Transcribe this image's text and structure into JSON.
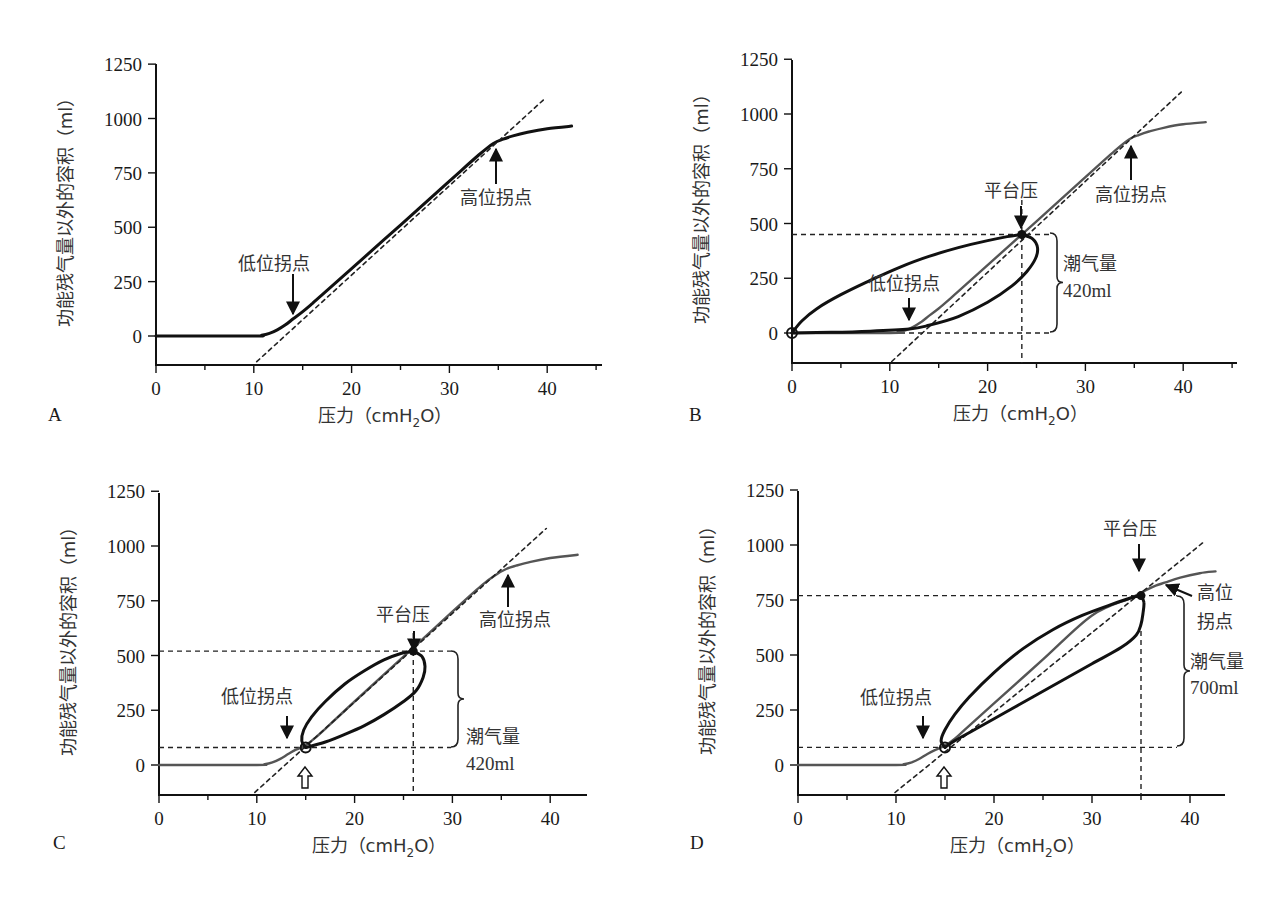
{
  "figure": {
    "panels_label": [
      "A",
      "B",
      "C",
      "D"
    ]
  },
  "chart_data": [
    {
      "panel": "A",
      "type": "line",
      "title": "",
      "xlabel": "压力（cmH2O）",
      "ylabel": "功能残气量以外的容积（ml）",
      "xlim": [
        0,
        46
      ],
      "ylim": [
        -133,
        1250
      ],
      "xticks": [
        0,
        10,
        20,
        30,
        40
      ],
      "yticks": [
        0,
        250,
        500,
        750,
        1000,
        1250
      ],
      "grid": false,
      "frame": {
        "x0": 156,
        "xs": 9.78,
        "y0": 336,
        "ys": 0.2175,
        "axis_bottom": 365,
        "axis_right": 602,
        "axis_top": 64
      },
      "series": [
        {
          "name": "静态压力-容积曲线",
          "style": "solid-black",
          "width": 3,
          "x": [
            0,
            10,
            10.8,
            11.6,
            12.4,
            13.2,
            14.0,
            15.0,
            16.0,
            17.0,
            20,
            25,
            30,
            33,
            34.5,
            35.5,
            36.5,
            38,
            40,
            42.5
          ],
          "y": [
            0,
            0,
            3,
            12,
            28,
            50,
            78,
            112,
            150,
            190,
            310,
            510,
            712,
            832,
            885,
            905,
            920,
            937,
            953,
            965
          ]
        },
        {
          "name": "线性段延长线",
          "style": "dashed",
          "width": 1.6,
          "x": [
            10.3,
            39.6
          ],
          "y": [
            -118,
            1085
          ]
        }
      ],
      "annotations": [
        {
          "text": "低位拐点",
          "x": 14.1,
          "y": 75,
          "text_x": 238,
          "text_y": 270,
          "arrow": "down",
          "arrow_x": 293,
          "arrow_y1": 274,
          "arrow_y2": 314
        },
        {
          "text": "高位拐点",
          "x": 35.0,
          "y": 890,
          "text_x": 460,
          "text_y": 204,
          "arrow": "up",
          "arrow_x": 496,
          "arrow_y1": 184,
          "arrow_y2": 149
        }
      ]
    },
    {
      "panel": "B",
      "type": "line",
      "title": "",
      "xlabel": "压力（cmH2O）",
      "ylabel": "功能残气量以外的容积（ml）",
      "xlim": [
        0,
        46
      ],
      "ylim": [
        -133,
        1250
      ],
      "xticks": [
        0,
        10,
        20,
        30,
        40
      ],
      "yticks": [
        0,
        250,
        500,
        750,
        1000,
        1250
      ],
      "grid": false,
      "frame": {
        "x0": 792,
        "xs": 9.78,
        "y0": 333,
        "ys": 0.219,
        "axis_bottom": 363,
        "axis_right": 1237,
        "axis_top": 60
      },
      "series": [
        {
          "name": "静态压力-容积曲线",
          "style": "solid-gray",
          "width": 2.4,
          "x": [
            0,
            10,
            10.8,
            11.6,
            12.4,
            13.2,
            14.0,
            15.0,
            16.0,
            17.0,
            20,
            25,
            30,
            33,
            34.5,
            35.5,
            36.5,
            38,
            40,
            42.3
          ],
          "y": [
            0,
            0,
            3,
            12,
            28,
            50,
            78,
            112,
            150,
            190,
            310,
            510,
            712,
            832,
            885,
            905,
            920,
            937,
            953,
            963
          ]
        },
        {
          "name": "线性段延长线",
          "style": "dashed",
          "width": 1.6,
          "x": [
            10.2,
            39.8
          ],
          "y": [
            -130,
            1100
          ]
        },
        {
          "name": "呼吸环-吸气支",
          "style": "loop",
          "width": 3,
          "x": [
            0,
            1,
            2.5,
            5,
            8,
            11,
            14,
            17,
            20,
            22,
            23.5
          ],
          "y": [
            0,
            55,
            110,
            175,
            240,
            300,
            350,
            390,
            422,
            440,
            450
          ]
        },
        {
          "name": "呼吸环-呼气支",
          "style": "loop",
          "width": 3,
          "x": [
            23.5,
            24.6,
            25.1,
            24.9,
            24.0,
            22.5,
            20,
            17,
            14,
            12,
            8,
            4,
            0
          ],
          "y": [
            450,
            430,
            390,
            340,
            280,
            215,
            140,
            75,
            35,
            18,
            8,
            3,
            0
          ]
        }
      ],
      "reference_lines": {
        "h": [
          450,
          0
        ],
        "v": [
          23.5
        ]
      },
      "points": [
        {
          "name": "起始点",
          "x": 0,
          "y": 0,
          "marker": "open-circle"
        },
        {
          "name": "平台压",
          "x": 23.5,
          "y": 450,
          "marker": "filled-circle"
        }
      ],
      "annotations": [
        {
          "text": "平台压",
          "text_x": 984,
          "text_y": 197,
          "arrow": "down",
          "arrow_x": 1021,
          "arrow_y1": 206,
          "arrow_y2": 228
        },
        {
          "text": "高位拐点",
          "text_x": 1095,
          "text_y": 201,
          "arrow": "up",
          "arrow_x": 1131,
          "arrow_y1": 180,
          "arrow_y2": 146
        },
        {
          "text": "低位拐点",
          "text_x": 868,
          "text_y": 290,
          "arrow": "down",
          "arrow_x": 909,
          "arrow_y1": 298,
          "arrow_y2": 320
        },
        {
          "text": "潮气量",
          "text_x": 1063,
          "text_y": 270
        },
        {
          "text": "420ml",
          "text_x": 1063,
          "text_y": 297,
          "kind": "num"
        }
      ],
      "brace": {
        "x": 1050,
        "y1": 233,
        "y2": 332
      },
      "tidal_volume": "420ml"
    },
    {
      "panel": "C",
      "type": "line",
      "title": "",
      "xlabel": "压力（cmH2O）",
      "ylabel": "功能残气量以外的容积（ml）",
      "xlim": [
        0,
        44
      ],
      "ylim": [
        -133,
        1250
      ],
      "xticks": [
        0,
        10,
        20,
        30,
        40
      ],
      "yticks": [
        0,
        250,
        500,
        750,
        1000,
        1250
      ],
      "grid": false,
      "frame": {
        "x0": 159,
        "xs": 9.78,
        "y0": 765,
        "ys": 0.219,
        "axis_bottom": 795,
        "axis_right": 587,
        "axis_top": 493
      },
      "series": [
        {
          "name": "静态压力-容积曲线",
          "style": "solid-gray",
          "width": 2.4,
          "x": [
            0,
            10,
            10.8,
            11.6,
            12.4,
            13.2,
            14.0,
            15.0,
            16.0,
            17.0,
            20,
            25,
            30,
            33,
            34.5,
            35.5,
            36.5,
            38,
            40,
            42.8
          ],
          "y": [
            0,
            0,
            3,
            12,
            28,
            50,
            70,
            90,
            125,
            165,
            290,
            495,
            700,
            820,
            870,
            895,
            910,
            928,
            945,
            960
          ]
        },
        {
          "name": "线性段延长线",
          "style": "dashed",
          "width": 1.6,
          "x": [
            9.8,
            39.6
          ],
          "y": [
            -125,
            1080
          ]
        },
        {
          "name": "呼吸环-吸气支",
          "style": "loop",
          "width": 3,
          "x": [
            15,
            14.6,
            14.8,
            15.6,
            17,
            19,
            21,
            23,
            24.8,
            26
          ],
          "y": [
            80,
            110,
            160,
            220,
            290,
            370,
            430,
            480,
            510,
            520
          ]
        },
        {
          "name": "呼吸环-呼气支",
          "style": "loop",
          "width": 3,
          "x": [
            26,
            26.9,
            27.2,
            27.0,
            26.3,
            25.0,
            23,
            21,
            19,
            17,
            15
          ],
          "y": [
            520,
            495,
            450,
            400,
            340,
            290,
            230,
            180,
            140,
            105,
            80
          ]
        }
      ],
      "reference_lines": {
        "h": [
          520,
          80
        ],
        "v": [
          26
        ]
      },
      "points": [
        {
          "name": "PEEP点",
          "x": 15,
          "y": 80,
          "marker": "open-circle"
        },
        {
          "name": "平台压",
          "x": 26,
          "y": 520,
          "marker": "filled-circle"
        }
      ],
      "annotations": [
        {
          "text": "平台压",
          "text_x": 376,
          "text_y": 621,
          "arrow": "down",
          "arrow_x": 414,
          "arrow_y1": 631,
          "arrow_y2": 651
        },
        {
          "text": "高位拐点",
          "text_x": 479,
          "text_y": 626,
          "arrow": "up",
          "arrow_x": 508,
          "arrow_y1": 607,
          "arrow_y2": 575
        },
        {
          "text": "低位拐点",
          "text_x": 221,
          "text_y": 703,
          "arrow": "down",
          "arrow_x": 287,
          "arrow_y1": 716,
          "arrow_y2": 738
        },
        {
          "text": "潮气量",
          "text_x": 466,
          "text_y": 743
        },
        {
          "text": "420ml",
          "text_x": 466,
          "text_y": 770,
          "kind": "num"
        }
      ],
      "peep_arrow": {
        "x": 305,
        "y_top": 767,
        "y_bottom": 788
      },
      "brace": {
        "x": 451,
        "y1": 651,
        "y2": 747
      },
      "tidal_volume": "420ml"
    },
    {
      "panel": "D",
      "type": "line",
      "title": "",
      "xlabel": "压力（cmH2O）",
      "ylabel": "功能残气量以外的容积（ml）",
      "xlim": [
        0,
        43.5
      ],
      "ylim": [
        -133,
        1250
      ],
      "xticks": [
        0,
        10,
        20,
        30,
        40
      ],
      "yticks": [
        0,
        250,
        500,
        750,
        1000,
        1250
      ],
      "grid": false,
      "frame": {
        "x0": 798,
        "xs": 9.8,
        "y0": 765,
        "ys": 0.22,
        "axis_bottom": 795,
        "axis_right": 1225,
        "axis_top": 491
      },
      "series": [
        {
          "name": "静态压力-容积曲线",
          "style": "solid-gray",
          "width": 2.4,
          "x": [
            0,
            10,
            10.8,
            11.6,
            12.4,
            13.2,
            14.0,
            15.0,
            16.0,
            17.0,
            20,
            25,
            30,
            34,
            35.5,
            36.5,
            37.5,
            39,
            41,
            42.6
          ],
          "y": [
            0,
            0,
            3,
            12,
            28,
            50,
            68,
            88,
            120,
            160,
            280,
            480,
            680,
            760,
            795,
            815,
            830,
            852,
            872,
            880
          ]
        },
        {
          "name": "线性段延长线",
          "style": "dashed",
          "width": 1.6,
          "x": [
            9.9,
            41.3
          ],
          "y": [
            -125,
            1010
          ]
        },
        {
          "name": "呼吸环-吸气支",
          "style": "loop",
          "width": 3,
          "x": [
            15,
            14.6,
            15.0,
            16,
            17.5,
            20,
            23,
            26,
            29,
            32,
            34,
            35
          ],
          "y": [
            80,
            110,
            160,
            230,
            310,
            420,
            530,
            615,
            680,
            730,
            760,
            770
          ]
        },
        {
          "name": "呼吸环-呼气支",
          "style": "loop",
          "width": 3,
          "x": [
            35,
            35.3,
            35.2,
            35.0,
            34.5,
            33,
            30,
            27,
            24,
            21,
            18,
            16,
            15
          ],
          "y": [
            770,
            740,
            690,
            640,
            590,
            535,
            460,
            385,
            310,
            235,
            160,
            110,
            80
          ]
        }
      ],
      "reference_lines": {
        "h": [
          770,
          80
        ],
        "v": [
          35
        ]
      },
      "points": [
        {
          "name": "PEEP点",
          "x": 15,
          "y": 80,
          "marker": "open-circle"
        },
        {
          "name": "平台压",
          "x": 35,
          "y": 770,
          "marker": "filled-circle"
        }
      ],
      "annotations": [
        {
          "text": "平台压",
          "text_x": 1103,
          "text_y": 535,
          "arrow": "down",
          "arrow_x": 1139,
          "arrow_y1": 544,
          "arrow_y2": 571
        },
        {
          "text": "高位",
          "text_x": 1197,
          "text_y": 599
        },
        {
          "text": "拐点",
          "text_x": 1197,
          "text_y": 628
        },
        {
          "text": "低位拐点",
          "text_x": 860,
          "text_y": 704,
          "arrow": "down",
          "arrow_x": 923,
          "arrow_y1": 716,
          "arrow_y2": 738
        },
        {
          "text": "潮气量",
          "text_x": 1190,
          "text_y": 668
        },
        {
          "text": "700ml",
          "text_x": 1190,
          "text_y": 694,
          "kind": "num"
        }
      ],
      "diag_arrow": {
        "x1": 1192,
        "y1": 596,
        "x2": 1166,
        "y2": 585
      },
      "peep_arrow": {
        "x": 944,
        "y_top": 767,
        "y_bottom": 788
      },
      "brace": {
        "x": 1177,
        "y1": 596,
        "y2": 746
      },
      "tidal_volume": "700ml"
    }
  ],
  "panel_letters": [
    {
      "text": "A",
      "x": 48,
      "y": 421
    },
    {
      "text": "B",
      "x": 689,
      "y": 421
    },
    {
      "text": "C",
      "x": 53,
      "y": 849
    },
    {
      "text": "D",
      "x": 690,
      "y": 849
    }
  ],
  "colors": {
    "curve_black": "#111111",
    "curve_gray": "#555555",
    "dashed": "#222222",
    "text": "#333333"
  }
}
